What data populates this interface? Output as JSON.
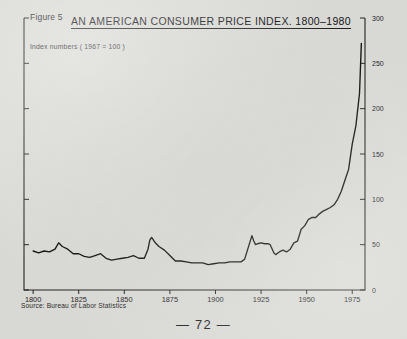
{
  "page": {
    "figure_label": "Figure 5",
    "page_number": "— 72 —",
    "paper_color": "#d8d8d4",
    "ink_color": "#101010"
  },
  "figure": {
    "title": "AN AMERICAN CONSUMER PRICE INDEX. 1800–1980",
    "subtitle": "Index numbers ( 1967 = 100 )",
    "source": "Source: Bureau of Labor Statistics"
  },
  "chart_data": {
    "type": "line",
    "title": "AN AMERICAN CONSUMER PRICE INDEX. 1800–1980",
    "subtitle": "Index numbers ( 1967 = 100 )",
    "xlabel": "",
    "ylabel": "Index numbers ( 1967 = 100 )",
    "xlim": [
      1795,
      1982
    ],
    "ylim": [
      0,
      300
    ],
    "xticks": [
      1800,
      1825,
      1850,
      1875,
      1900,
      1925,
      1950,
      1975
    ],
    "xtick_labels": [
      "1800",
      "1825",
      "1850",
      "1875",
      "1900",
      "1925",
      "1950",
      "1975"
    ],
    "yticks": [
      0,
      50,
      100,
      150,
      200,
      250,
      300
    ],
    "ytick_labels": [
      "0",
      "50",
      "100",
      "150",
      "200",
      "250",
      "300"
    ],
    "y_axis_position": "right",
    "grid": false,
    "legend": null,
    "legend_position": "none",
    "annotations": [],
    "series": [
      {
        "name": "Consumer Price Index (1967 = 100)",
        "color": "#101010",
        "x": [
          1800,
          1803,
          1806,
          1809,
          1812,
          1814,
          1816,
          1819,
          1822,
          1825,
          1828,
          1831,
          1834,
          1837,
          1840,
          1843,
          1846,
          1849,
          1852,
          1855,
          1858,
          1861,
          1863,
          1864,
          1865,
          1867,
          1869,
          1872,
          1875,
          1878,
          1881,
          1884,
          1887,
          1890,
          1893,
          1896,
          1899,
          1902,
          1905,
          1908,
          1911,
          1914,
          1916,
          1918,
          1920,
          1921,
          1922,
          1923,
          1925,
          1927,
          1929,
          1930,
          1932,
          1933,
          1935,
          1937,
          1939,
          1941,
          1943,
          1945,
          1947,
          1949,
          1951,
          1953,
          1955,
          1957,
          1959,
          1961,
          1963,
          1965,
          1967,
          1969,
          1971,
          1973,
          1975,
          1977,
          1979,
          1980
        ],
        "y": [
          43,
          41,
          43,
          42,
          45,
          52,
          48,
          45,
          40,
          40,
          37,
          36,
          38,
          40,
          35,
          33,
          34,
          35,
          36,
          38,
          35,
          35,
          45,
          55,
          58,
          52,
          48,
          44,
          38,
          32,
          32,
          31,
          30,
          30,
          30,
          28,
          29,
          30,
          30,
          31,
          31,
          31,
          34,
          47,
          60,
          54,
          50,
          51,
          52,
          51,
          51,
          50,
          41,
          39,
          42,
          44,
          42,
          45,
          52,
          54,
          67,
          71,
          78,
          80,
          80,
          84,
          87,
          89,
          91,
          94,
          100,
          109,
          121,
          133,
          161,
          181,
          217,
          272
        ]
      }
    ]
  }
}
